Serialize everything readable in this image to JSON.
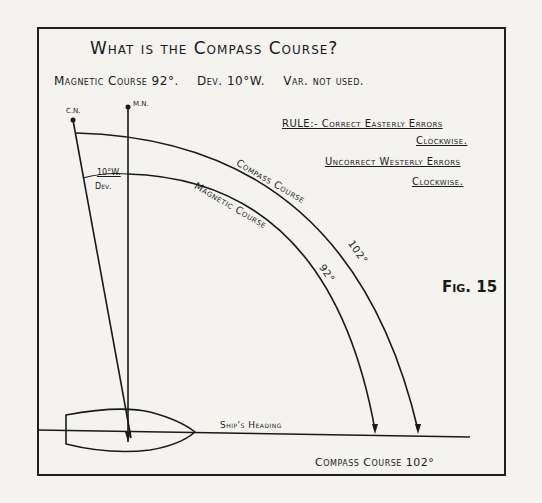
{
  "diagram": {
    "title": "What is the Compass Course?",
    "given": {
      "magnetic_course": "Magnetic Course 92°.",
      "deviation": "Dev. 10°W.",
      "variation": "Var. not used."
    },
    "rule": {
      "line1": "RULE:- Correct Easterly Errors",
      "line2": "Clockwise.",
      "line3": "Uncorrect Westerly Errors",
      "line4": "Clockwise."
    },
    "markers": {
      "compass_north": "C.N.",
      "magnetic_north": "M.N."
    },
    "deviation_label": {
      "value": "10°W.",
      "name": "Dev."
    },
    "arcs": {
      "compass_course": "Compass Course",
      "compass_course_value": "102°",
      "magnetic_course": "Magnetic Course",
      "magnetic_course_value": "92°"
    },
    "ship_heading_label": "Ship's Heading",
    "result": "Compass Course 102°",
    "figure_label": "Fig. 15"
  }
}
